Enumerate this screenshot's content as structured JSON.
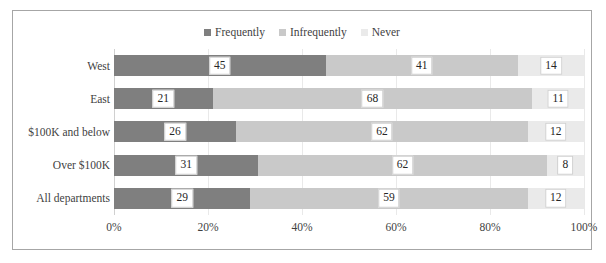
{
  "chart_data": {
    "type": "bar",
    "orientation": "horizontal",
    "stacked": true,
    "stacked_percent": true,
    "title": "",
    "xlabel": "",
    "ylabel": "",
    "xlim": [
      0,
      100
    ],
    "xticks": [
      "0%",
      "20%",
      "40%",
      "60%",
      "80%",
      "100%"
    ],
    "xtick_values": [
      0,
      20,
      40,
      60,
      80,
      100
    ],
    "grid": true,
    "legend_position": "top-center",
    "categories": [
      "West",
      "East",
      "$100K and below",
      "Over $100K",
      "All departments"
    ],
    "series": [
      {
        "name": "Frequently",
        "color": "#7f7f7f",
        "values": [
          45,
          21,
          26,
          31,
          29
        ]
      },
      {
        "name": "Infrequently",
        "color": "#c9c9c9",
        "values": [
          41,
          68,
          62,
          62,
          59
        ]
      },
      {
        "name": "Never",
        "color": "#eaeaea",
        "values": [
          14,
          11,
          12,
          8,
          12
        ]
      }
    ],
    "rows": [
      {
        "category": "West",
        "segments": [
          {
            "series": "Frequently",
            "value": 45
          },
          {
            "series": "Infrequently",
            "value": 41
          },
          {
            "series": "Never",
            "value": 14
          }
        ]
      },
      {
        "category": "East",
        "segments": [
          {
            "series": "Frequently",
            "value": 21
          },
          {
            "series": "Infrequently",
            "value": 68
          },
          {
            "series": "Never",
            "value": 11
          }
        ]
      },
      {
        "category": "$100K and below",
        "segments": [
          {
            "series": "Frequently",
            "value": 26
          },
          {
            "series": "Infrequently",
            "value": 62
          },
          {
            "series": "Never",
            "value": 12
          }
        ]
      },
      {
        "category": "Over $100K",
        "segments": [
          {
            "series": "Frequently",
            "value": 31
          },
          {
            "series": "Infrequently",
            "value": 62
          },
          {
            "series": "Never",
            "value": 8
          }
        ]
      },
      {
        "category": "All departments",
        "segments": [
          {
            "series": "Frequently",
            "value": 29
          },
          {
            "series": "Infrequently",
            "value": 59
          },
          {
            "series": "Never",
            "value": 12
          }
        ]
      }
    ]
  },
  "legend": {
    "items": [
      {
        "label": "Frequently",
        "color": "#7f7f7f"
      },
      {
        "label": "Infrequently",
        "color": "#c9c9c9"
      },
      {
        "label": "Never",
        "color": "#eaeaea"
      }
    ]
  },
  "colors": {
    "frame_border": "#a6a6a6",
    "gridline": "#e9e9e9",
    "axis": "#d0d0d0",
    "text": "#3f3f3f",
    "label_box_bg": "#ffffff",
    "label_box_border": "#cfcfcf"
  }
}
